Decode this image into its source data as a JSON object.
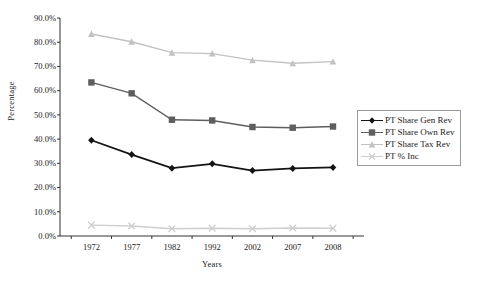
{
  "chart_data": {
    "type": "line",
    "title": "",
    "xlabel": "Years",
    "ylabel": "Percentage",
    "categories": [
      "1972",
      "1977",
      "1982",
      "1992",
      "2002",
      "2007",
      "2008"
    ],
    "x": [
      1972,
      1977,
      1982,
      1992,
      2002,
      2007,
      2008
    ],
    "ylim": [
      0,
      90
    ],
    "ytick_labels": [
      "0.0%",
      "10.0%",
      "20.0%",
      "30.0%",
      "40.0%",
      "50.0%",
      "60.0%",
      "70.0%",
      "80.0%",
      "90.0%"
    ],
    "ytick_values": [
      0,
      10,
      20,
      30,
      40,
      50,
      60,
      70,
      80,
      90
    ],
    "grid": false,
    "legend_position": "right",
    "series": [
      {
        "name": "PT Share Gen Rev",
        "marker": "diamond",
        "color": "#141414",
        "values": [
          39.5,
          33.6,
          28.0,
          29.8,
          27.0,
          27.9,
          28.3
        ]
      },
      {
        "name": "PT Share Own Rev",
        "marker": "square",
        "color": "#5e5e5e",
        "values": [
          63.4,
          58.9,
          48.0,
          47.7,
          45.0,
          44.7,
          45.2
        ]
      },
      {
        "name": "PT Share Tax Rev",
        "marker": "triangle",
        "color": "#c2c2c2",
        "values": [
          83.4,
          80.2,
          75.7,
          75.3,
          72.6,
          71.3,
          72.0
        ]
      },
      {
        "name": "PT % Inc",
        "marker": "x",
        "color": "#cfcfcf",
        "values": [
          4.5,
          4.1,
          3.0,
          3.2,
          3.0,
          3.3,
          3.2
        ]
      }
    ]
  },
  "legend": {
    "items": [
      {
        "label": "PT Share Gen Rev"
      },
      {
        "label": "PT Share Own Rev"
      },
      {
        "label": "PT Share Tax Rev"
      },
      {
        "label": "PT % Inc"
      }
    ]
  }
}
